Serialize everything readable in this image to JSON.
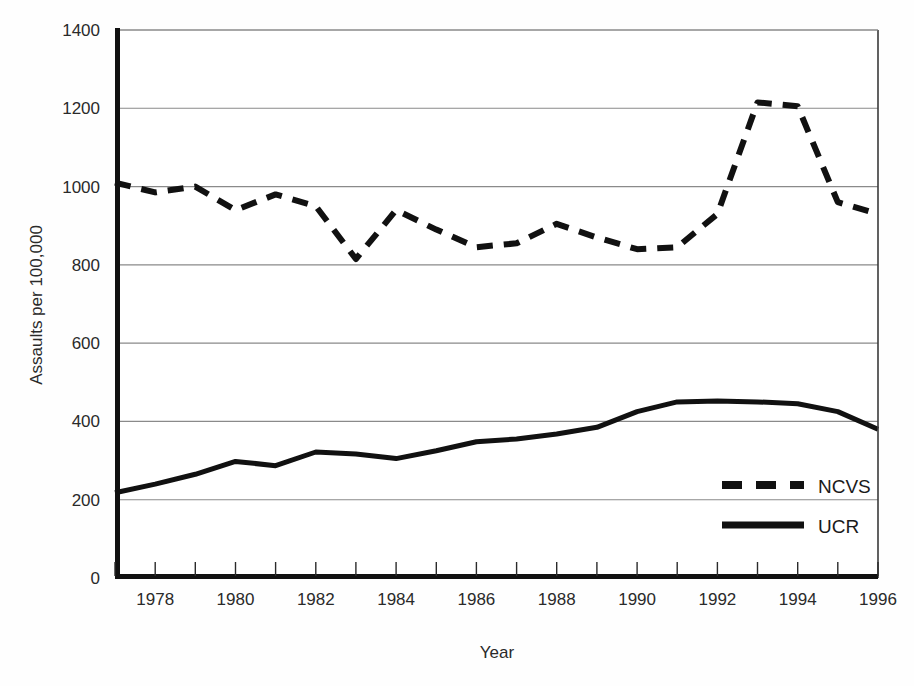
{
  "chart_data": {
    "type": "line",
    "title": "",
    "xlabel": "Year",
    "ylabel": "Assaults per 100,000",
    "xlim": [
      1977,
      1996
    ],
    "ylim": [
      0,
      1400
    ],
    "grid": true,
    "legend_position": "bottom-right",
    "y_ticks": [
      0,
      200,
      400,
      600,
      800,
      1000,
      1200,
      1400
    ],
    "y_tick_labels": [
      "0",
      "200",
      "400",
      "600",
      "800",
      "1000",
      "1200",
      "1400"
    ],
    "x_ticks": [
      1977,
      1978,
      1979,
      1980,
      1981,
      1982,
      1983,
      1984,
      1985,
      1986,
      1987,
      1988,
      1989,
      1990,
      1991,
      1992,
      1993,
      1994,
      1995,
      1996
    ],
    "x_tick_labels": [
      "",
      "1978",
      "",
      "1980",
      "",
      "1982",
      "",
      "1984",
      "",
      "1986",
      "",
      "1988",
      "",
      "1990",
      "",
      "1992",
      "",
      "1994",
      "",
      "1996"
    ],
    "x": [
      1977,
      1978,
      1979,
      1980,
      1981,
      1982,
      1983,
      1984,
      1985,
      1986,
      1987,
      1988,
      1989,
      1990,
      1991,
      1992,
      1993,
      1994,
      1995,
      1996
    ],
    "series": [
      {
        "name": "NCVS",
        "style": "dashed",
        "color": "#111111",
        "values": [
          1010,
          985,
          1000,
          940,
          980,
          950,
          815,
          940,
          890,
          845,
          855,
          905,
          870,
          840,
          845,
          930,
          1215,
          1205,
          960,
          930
        ]
      },
      {
        "name": "UCR",
        "style": "solid",
        "color": "#111111",
        "values": [
          218,
          240,
          265,
          298,
          287,
          322,
          317,
          305,
          325,
          348,
          355,
          368,
          385,
          425,
          450,
          452,
          450,
          445,
          425,
          380
        ]
      }
    ],
    "legend": [
      {
        "label": "NCVS",
        "style": "dashed"
      },
      {
        "label": "UCR",
        "style": "solid"
      }
    ]
  },
  "axes": {
    "x_title": "Year",
    "y_title": "Assaults per 100,000"
  }
}
